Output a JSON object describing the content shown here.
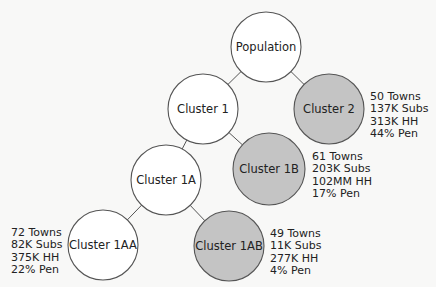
{
  "colors": {
    "background": "#f8f8f7",
    "highlight_fill": "#c4c4c4",
    "plain_fill": "#ffffff",
    "stroke": "#555555"
  },
  "nodes": [
    {
      "id": "population",
      "label": "Population",
      "cx": 266,
      "cy": 47,
      "r": 35,
      "shaded": false
    },
    {
      "id": "cluster-1",
      "label": "Cluster 1",
      "cx": 203,
      "cy": 109,
      "r": 35,
      "shaded": false
    },
    {
      "id": "cluster-2",
      "label": "Cluster 2",
      "cx": 329,
      "cy": 109,
      "r": 35,
      "shaded": true
    },
    {
      "id": "cluster-1a",
      "label": "Cluster 1A",
      "cx": 166,
      "cy": 180,
      "r": 35,
      "shaded": false
    },
    {
      "id": "cluster-1b",
      "label": "Cluster 1B",
      "cx": 269,
      "cy": 169,
      "r": 36,
      "shaded": true
    },
    {
      "id": "cluster-1aa",
      "label": "Cluster 1AA",
      "cx": 103,
      "cy": 245,
      "r": 35,
      "shaded": false
    },
    {
      "id": "cluster-1ab",
      "label": "Cluster 1AB",
      "cx": 229,
      "cy": 246,
      "r": 35,
      "shaded": true
    }
  ],
  "edges": [
    [
      "population",
      "cluster-1"
    ],
    [
      "population",
      "cluster-2"
    ],
    [
      "cluster-1",
      "cluster-1a"
    ],
    [
      "cluster-1",
      "cluster-1b"
    ],
    [
      "cluster-1a",
      "cluster-1aa"
    ],
    [
      "cluster-1a",
      "cluster-1ab"
    ]
  ],
  "stats": {
    "cluster_2": {
      "towns": "50 Towns",
      "subs": "137K Subs",
      "hh": "313K HH",
      "pen": "44% Pen"
    },
    "cluster_1b": {
      "towns": "61 Towns",
      "subs": "203K Subs",
      "hh": "102MM HH",
      "pen": "17% Pen"
    },
    "cluster_1aa": {
      "towns": "72 Towns",
      "subs": "82K Subs",
      "hh": "375K HH",
      "pen": "22% Pen"
    },
    "cluster_1ab": {
      "towns": "49 Towns",
      "subs": "11K Subs",
      "hh": "277K HH",
      "pen": "4% Pen"
    }
  }
}
